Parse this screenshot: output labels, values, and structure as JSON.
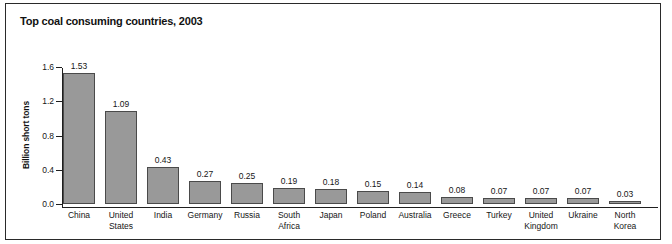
{
  "chart_data": {
    "type": "bar",
    "title": "Top coal consuming countries, 2003",
    "xlabel": "",
    "ylabel": "Billion short tons",
    "ylim": [
      0.0,
      1.6
    ],
    "yticks": [
      "0.0",
      "0.4",
      "0.8",
      "1.2",
      "1.6"
    ],
    "ytick_values": [
      0.0,
      0.4,
      0.8,
      1.2,
      1.6
    ],
    "grid": false,
    "legend": "none",
    "bar_color": "#999999",
    "bar_edge_color": "#4a4a4a",
    "categories": [
      "China",
      "United States",
      "India",
      "Germany",
      "Russia",
      "South Africa",
      "Japan",
      "Poland",
      "Australia",
      "Greece",
      "Turkey",
      "United Kingdom",
      "Ukraine",
      "North Korea"
    ],
    "category_lines": [
      [
        "China"
      ],
      [
        "United",
        "States"
      ],
      [
        "India"
      ],
      [
        "Germany"
      ],
      [
        "Russia"
      ],
      [
        "South",
        "Africa"
      ],
      [
        "Japan"
      ],
      [
        "Poland"
      ],
      [
        "Australia"
      ],
      [
        "Greece"
      ],
      [
        "Turkey"
      ],
      [
        "United",
        "Kingdom"
      ],
      [
        "Ukraine"
      ],
      [
        "North",
        "Korea"
      ]
    ],
    "values": [
      1.53,
      1.09,
      0.43,
      0.27,
      0.25,
      0.19,
      0.18,
      0.15,
      0.14,
      0.08,
      0.07,
      0.07,
      0.07,
      0.03
    ],
    "value_labels": [
      "1.53",
      "1.09",
      "0.43",
      "0.27",
      "0.25",
      "0.19",
      "0.18",
      "0.15",
      "0.14",
      "0.08",
      "0.07",
      "0.07",
      "0.07",
      "0.03"
    ]
  }
}
